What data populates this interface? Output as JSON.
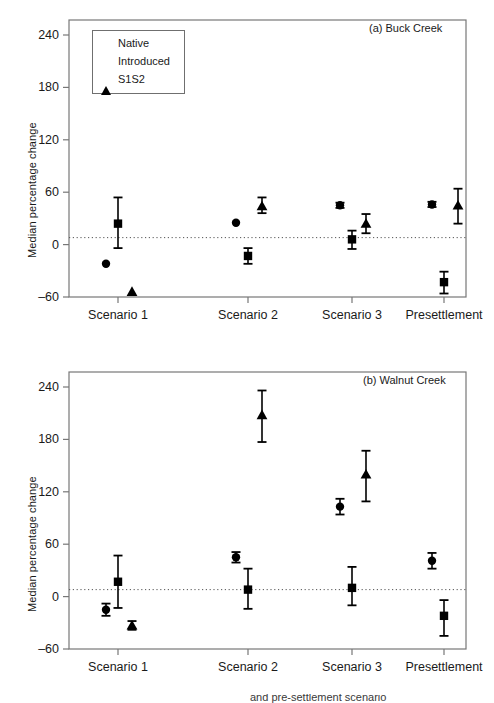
{
  "figure": {
    "ylabel": "Median percentage change",
    "xtick_labels": [
      "Scenario 1",
      "Scenario 2",
      "Scenario 3",
      "Presettlement"
    ],
    "ytick_labels": [
      "240",
      "180",
      "120",
      "60",
      "0",
      "-60"
    ],
    "legend": {
      "items": [
        {
          "label": "Native",
          "marker": "circle-marker"
        },
        {
          "label": "Introduced",
          "marker": "square-marker"
        },
        {
          "label": "S1S2",
          "marker": "triangle-marker"
        }
      ]
    },
    "panel_a_title": "(a) Buck Creek",
    "panel_b_title": "(b) Walnut Creek",
    "caption_fragment": "and pre-settlement scenario"
  },
  "chart_data": [
    {
      "type": "scatter",
      "title": "(a) Buck Creek",
      "xlabel": "",
      "ylabel": "Median percentage change",
      "categories": [
        "Scenario 1",
        "Scenario 2",
        "Scenario 3",
        "Presettlement"
      ],
      "ylim": [
        -75,
        258
      ],
      "yticks": [
        240,
        180,
        120,
        60,
        0,
        -60
      ],
      "grid": false,
      "reference_line": {
        "y": 8,
        "style": "dotted"
      },
      "legend_position": "upper-left",
      "series": [
        {
          "name": "Native",
          "marker": "circle",
          "values": [
            -22,
            25,
            45,
            46
          ],
          "err_low": [
            -22,
            25,
            42,
            43
          ],
          "err_high": [
            -22,
            25,
            48,
            49
          ]
        },
        {
          "name": "Introduced",
          "marker": "square",
          "values": [
            24,
            -13,
            6,
            -43
          ],
          "err_low": [
            -4,
            -22,
            -5,
            -56
          ],
          "err_high": [
            54,
            -4,
            16,
            -31
          ]
        },
        {
          "name": "S1S2",
          "marker": "triangle",
          "values": [
            -54,
            44,
            24,
            45
          ],
          "err_low": [
            -54,
            36,
            13,
            24
          ],
          "err_high": [
            -54,
            54,
            35,
            64
          ]
        }
      ]
    },
    {
      "type": "scatter",
      "title": "(b) Walnut Creek",
      "xlabel": "",
      "ylabel": "Median percentage change",
      "categories": [
        "Scenario 1",
        "Scenario 2",
        "Scenario 3",
        "Presettlement"
      ],
      "ylim": [
        -75,
        258
      ],
      "yticks": [
        240,
        180,
        120,
        60,
        0,
        -60
      ],
      "grid": false,
      "reference_line": {
        "y": 8,
        "style": "dotted"
      },
      "legend_position": "none",
      "series": [
        {
          "name": "Native",
          "marker": "circle",
          "values": [
            -15,
            45,
            103,
            41
          ],
          "err_low": [
            -22,
            39,
            94,
            32
          ],
          "err_high": [
            -8,
            51,
            112,
            50
          ]
        },
        {
          "name": "Introduced",
          "marker": "square",
          "values": [
            17,
            8,
            10,
            -22
          ],
          "err_low": [
            -13,
            -14,
            -10,
            -45
          ],
          "err_high": [
            47,
            32,
            34,
            -4
          ]
        },
        {
          "name": "S1S2",
          "marker": "triangle",
          "values": [
            -33,
            208,
            140,
            null
          ],
          "err_low": [
            -38,
            177,
            109,
            null
          ],
          "err_high": [
            -28,
            236,
            167,
            null
          ]
        }
      ]
    }
  ]
}
